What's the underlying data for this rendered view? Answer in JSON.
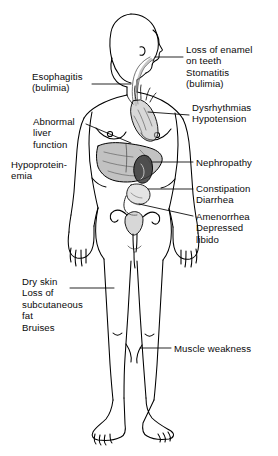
{
  "diagram": {
    "background_color": "#ffffff",
    "line_color": "#000000",
    "text_color": "#0a0a0a",
    "labels": [
      {
        "id": "loss-of-enamel",
        "text": "Loss of enamel\non teeth\nStomatitis\n(bulimia)",
        "side": "right",
        "x": 186,
        "y": 44,
        "leader": {
          "from_x": 183,
          "from_y": 57,
          "to_x": 155,
          "to_y": 57
        }
      },
      {
        "id": "esophagitis",
        "text": "Esophagitis\n(bulimia)",
        "side": "left",
        "x": 32,
        "y": 71,
        "leader": {
          "from_x": 92,
          "from_y": 84,
          "to_x": 131,
          "to_y": 84
        }
      },
      {
        "id": "dysrhythmias",
        "text": "Dysrhythmias\nHypotension",
        "side": "right",
        "x": 192,
        "y": 102,
        "leader": {
          "from_x": 189,
          "from_y": 115,
          "to_x": 148,
          "to_y": 112
        }
      },
      {
        "id": "abnormal-liver",
        "text": "Abnormal\nliver\nfunction",
        "side": "left",
        "x": 33,
        "y": 116,
        "leader": {
          "from_x": 86,
          "from_y": 124,
          "to_x": 131,
          "to_y": 143
        }
      },
      {
        "id": "nephropathy",
        "text": "Nephropathy",
        "side": "right",
        "x": 196,
        "y": 157,
        "leader": {
          "from_x": 193,
          "from_y": 162,
          "to_x": 152,
          "to_y": 162
        }
      },
      {
        "id": "hypoproteinemia",
        "text": "Hypoprotein-\nemia",
        "side": "left",
        "x": 11,
        "y": 159,
        "leader": null
      },
      {
        "id": "constipation",
        "text": "Constipation\nDiarrhea",
        "side": "right",
        "x": 196,
        "y": 183,
        "leader": {
          "from_x": 193,
          "from_y": 189,
          "to_x": 148,
          "to_y": 189
        }
      },
      {
        "id": "amenorrhea",
        "text": "Amenorrhea\nDepressed\nlibido",
        "side": "right",
        "x": 196,
        "y": 211,
        "leader": {
          "from_x": 193,
          "from_y": 216,
          "to_x": 139,
          "to_y": 204
        }
      },
      {
        "id": "dry-skin",
        "text": "Dry skin\nLoss of\nsubcutaneous\nfat\nBruises",
        "side": "left",
        "x": 22,
        "y": 276,
        "leader": {
          "from_x": 70,
          "from_y": 288,
          "to_x": 114,
          "to_y": 288
        }
      },
      {
        "id": "muscle-weakness",
        "text": "Muscle weakness",
        "side": "right",
        "x": 174,
        "y": 343,
        "leader": {
          "from_x": 171,
          "from_y": 348,
          "to_x": 140,
          "to_y": 348
        }
      }
    ],
    "organs": [
      {
        "id": "esophagus",
        "label": "esophagus"
      },
      {
        "id": "heart",
        "label": "heart"
      },
      {
        "id": "liver",
        "label": "liver"
      },
      {
        "id": "kidney",
        "label": "kidney"
      },
      {
        "id": "intestine",
        "label": "intestine"
      },
      {
        "id": "uterus",
        "label": "uterus"
      }
    ]
  }
}
